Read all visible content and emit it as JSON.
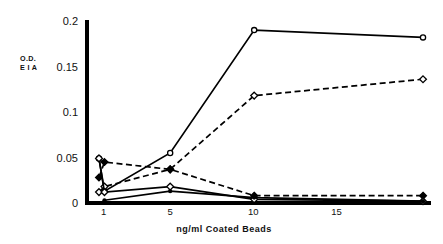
{
  "chart_data": {
    "type": "line",
    "title": "",
    "subtitle": "",
    "xlabel": "ng/ml  Coated  Beads",
    "ylabel_line1": "O.D.",
    "ylabel_line2": "E I A",
    "xlim": [
      0.0,
      20.5
    ],
    "ylim": [
      0,
      0.2
    ],
    "grid": false,
    "legend": "none",
    "xticks": [
      1,
      5,
      10,
      15
    ],
    "xticklabels": [
      "1",
      "5",
      "10",
      "15"
    ],
    "yticks": [
      0,
      0.05,
      0.1,
      0.15,
      0.2
    ],
    "yticklabels": [
      "0",
      "0.05",
      "0.1",
      "0.15",
      "0.2"
    ],
    "series": [
      {
        "name": "series-1-solid-circle",
        "linestyle": "solid",
        "marker": "open-circle",
        "color": "#000000",
        "x": [
          0.72,
          1.05,
          5.0,
          10.05,
          20.2
        ],
        "y": [
          0.049,
          0.013,
          0.055,
          0.19,
          0.182
        ]
      },
      {
        "name": "series-2-dashed-diamond",
        "linestyle": "dashed",
        "marker": "open-diamond",
        "color": "#000000",
        "x": [
          0.72,
          1.05,
          5.0,
          10.05,
          20.2
        ],
        "y": [
          0.012,
          0.018,
          0.037,
          0.118,
          0.136
        ]
      },
      {
        "name": "series-3-dashed-filled",
        "linestyle": "dashed",
        "marker": "filled-diamond",
        "color": "#000000",
        "x": [
          0.72,
          1.05,
          5.0,
          10.05,
          20.2
        ],
        "y": [
          0.028,
          0.045,
          0.037,
          0.008,
          0.008
        ]
      },
      {
        "name": "series-4-solid-descending",
        "linestyle": "solid",
        "marker": "open-diamond",
        "color": "#000000",
        "x": [
          0.72,
          1.05,
          5.0,
          10.05,
          20.2
        ],
        "y": [
          0.049,
          0.012,
          0.018,
          0.004,
          0.002
        ]
      },
      {
        "name": "series-5-solid-baseline",
        "linestyle": "solid",
        "marker": "filled-dot",
        "color": "#000000",
        "x": [
          1.05,
          5.0,
          10.05,
          20.2
        ],
        "y": [
          0.003,
          0.013,
          0.006,
          0.002
        ]
      }
    ]
  },
  "geometry": {
    "plot_left": 87,
    "plot_right": 428,
    "plot_top": 21,
    "plot_bottom": 203,
    "axis_line_width": 4
  },
  "colors": {
    "ink": "#000000",
    "background": "#ffffff"
  }
}
